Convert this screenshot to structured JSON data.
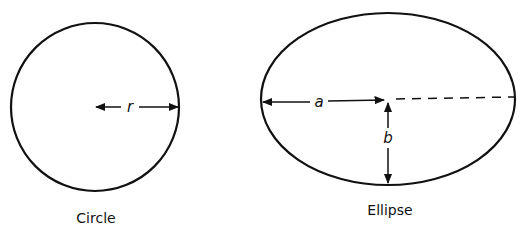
{
  "figures": [
    {
      "shape": "circle",
      "caption": "Circle",
      "dimension_labels": [
        "r"
      ],
      "geometry": {
        "cx": 95,
        "cy": 107,
        "r": 84
      }
    },
    {
      "shape": "ellipse",
      "caption": "Ellipse",
      "dimension_labels": [
        "a",
        "b"
      ],
      "geometry": {
        "cx": 388,
        "cy": 99,
        "rx": 127,
        "ry": 86
      }
    }
  ],
  "colors": {
    "stroke": "#111111",
    "background": "#ffffff"
  }
}
